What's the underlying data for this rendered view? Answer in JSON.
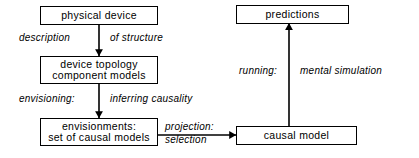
{
  "diagram": {
    "stroke_color": "#000000",
    "background_color": "#ffffff",
    "boxes": [
      {
        "id": "physical-device",
        "lines": [
          "physical  device"
        ]
      },
      {
        "id": "device-topology",
        "lines": [
          "device  topology",
          "component  models"
        ]
      },
      {
        "id": "envisionments",
        "lines": [
          "envisionments:",
          "set of  causal  models"
        ]
      },
      {
        "id": "predictions",
        "lines": [
          "predictions"
        ]
      },
      {
        "id": "causal-model",
        "lines": [
          "causal  model"
        ]
      }
    ],
    "labels": {
      "description": "description",
      "of_structure": "of  structure",
      "envisioning": "envisioning:",
      "inferring_causality": "inferring  causality",
      "projection": "projection:",
      "selection": "selection",
      "running": "running:",
      "mental_simulation": "mental  simulation"
    },
    "arrows": [
      {
        "id": "arrow-physical-to-topology",
        "from": "physical-device",
        "to": "device-topology",
        "direction": "down"
      },
      {
        "id": "arrow-topology-to-envisionments",
        "from": "device-topology",
        "to": "envisionments",
        "direction": "down"
      },
      {
        "id": "arrow-envisionments-to-causal",
        "from": "envisionments",
        "to": "causal-model",
        "direction": "right"
      },
      {
        "id": "arrow-causal-to-predictions",
        "from": "causal-model",
        "to": "predictions",
        "direction": "up"
      }
    ]
  }
}
